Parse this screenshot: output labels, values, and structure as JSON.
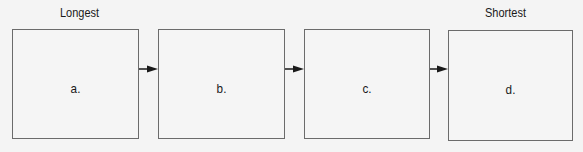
{
  "labels": {
    "start": "Longest",
    "end": "Shortest"
  },
  "boxes": [
    {
      "label": "a."
    },
    {
      "label": "b."
    },
    {
      "label": "c."
    },
    {
      "label": "d."
    }
  ],
  "colors": {
    "border": "#6b6b6b",
    "arrow": "#1a1a1a",
    "background": "#f4f4f4"
  }
}
